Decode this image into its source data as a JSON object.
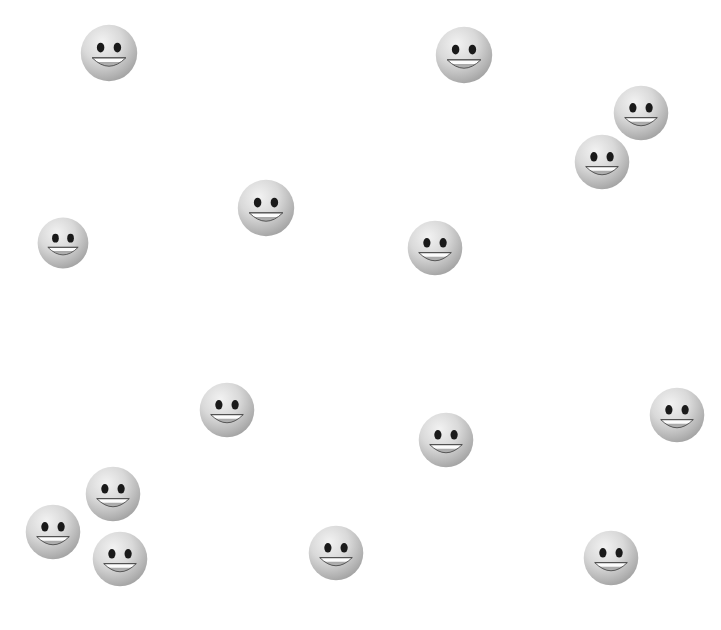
{
  "scene": {
    "title": "Smiley face scatter",
    "background_color": "#ffffff",
    "width": 721,
    "height": 630,
    "item_count": 13,
    "icon_name": "smiley-face-icon",
    "icon_label": "grinning smiley face",
    "palette": {
      "face_light": "#f2f2f2",
      "face_mid": "#d9d9d9",
      "face_shadow": "#b3b3b3",
      "face_edge": "#9c9c9c",
      "eye": "#1a1a1a",
      "mouth_outline": "#4d4d4d",
      "teeth": "#fcfcfc",
      "mouth_inner": "#a8a8a8",
      "background": "#ffffff"
    },
    "faces": [
      {
        "id": "face-1",
        "name": "smiley-top-left",
        "x": 79,
        "y": 23,
        "size": 60
      },
      {
        "id": "face-2",
        "name": "smiley-top-center-right",
        "x": 434,
        "y": 25,
        "size": 60
      },
      {
        "id": "face-3",
        "name": "smiley-top-right-upper",
        "x": 612,
        "y": 84,
        "size": 58
      },
      {
        "id": "face-4",
        "name": "smiley-top-right-lower",
        "x": 573,
        "y": 133,
        "size": 58
      },
      {
        "id": "face-5",
        "name": "smiley-middle-center",
        "x": 236,
        "y": 178,
        "size": 60
      },
      {
        "id": "face-6",
        "name": "smiley-middle-left",
        "x": 36,
        "y": 216,
        "size": 54
      },
      {
        "id": "face-7",
        "name": "smiley-middle-right",
        "x": 406,
        "y": 219,
        "size": 58
      },
      {
        "id": "face-8",
        "name": "smiley-lower-center-left",
        "x": 198,
        "y": 381,
        "size": 58
      },
      {
        "id": "face-9",
        "name": "smiley-lower-center",
        "x": 417,
        "y": 411,
        "size": 58
      },
      {
        "id": "face-10",
        "name": "smiley-lower-right-edge",
        "x": 648,
        "y": 386,
        "size": 58
      },
      {
        "id": "face-11",
        "name": "smiley-cluster-upper",
        "x": 84,
        "y": 465,
        "size": 58
      },
      {
        "id": "face-12",
        "name": "smiley-cluster-left",
        "x": 24,
        "y": 503,
        "size": 58
      },
      {
        "id": "face-13",
        "name": "smiley-cluster-lower",
        "x": 91,
        "y": 530,
        "size": 58
      },
      {
        "id": "face-14",
        "name": "smiley-bottom-center",
        "x": 307,
        "y": 524,
        "size": 58
      },
      {
        "id": "face-15",
        "name": "smiley-bottom-right",
        "x": 582,
        "y": 529,
        "size": 58
      }
    ]
  }
}
